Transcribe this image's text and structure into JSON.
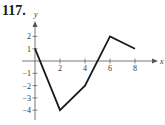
{
  "problem": {
    "number": "117."
  },
  "chart_data": {
    "type": "line",
    "title": "",
    "xlabel": "x",
    "ylabel": "y",
    "x": [
      0,
      2,
      4,
      6,
      8
    ],
    "series": [
      {
        "name": "f",
        "values": [
          1,
          -4,
          -2,
          2,
          1
        ]
      }
    ],
    "x_ticks": [
      "2",
      "4",
      "6",
      "8"
    ],
    "y_ticks": [
      "2",
      "1",
      "-1",
      "-2",
      "-3",
      "-4"
    ],
    "xlim": [
      0,
      9
    ],
    "ylim": [
      -5,
      3
    ],
    "grid": false,
    "legend": null,
    "line_color": "#1a1a1a"
  }
}
